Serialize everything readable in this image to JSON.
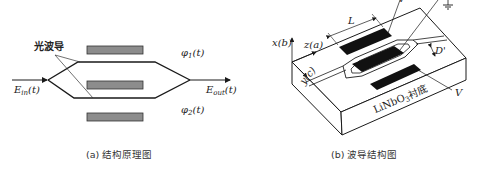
{
  "panel_a": {
    "title": "结构原理图",
    "caption": "(a) 结构原理图",
    "waveguide_label": "光波导",
    "input_field": {
      "base": "E",
      "sub": "in",
      "arg": "(t)"
    },
    "output_field": {
      "base": "E",
      "sub": "out",
      "arg": "(t)"
    },
    "phase_top": {
      "base": "φ",
      "sub": "1",
      "arg": "(t)"
    },
    "phase_bottom": {
      "base": "φ",
      "sub": "2",
      "arg": "(t)"
    },
    "colors": {
      "electrode": "#8c8c8c",
      "line": "#1a1a1a"
    }
  },
  "panel_b": {
    "title": "波导结构图",
    "caption": "(b) 波导结构图",
    "axis_x": "x(b)",
    "axis_z": "z(a)",
    "axis_y": "y(c)",
    "length_label": "L",
    "gap_label": "D'",
    "voltage_top": "V",
    "voltage_bottom": "V",
    "substrate": {
      "prefix": "LiNbO",
      "sub": "3",
      "suffix": "衬底"
    },
    "ground_symbol": "ground-icon",
    "colors": {
      "electrode": "#111111",
      "line": "#1a1a1a"
    }
  }
}
